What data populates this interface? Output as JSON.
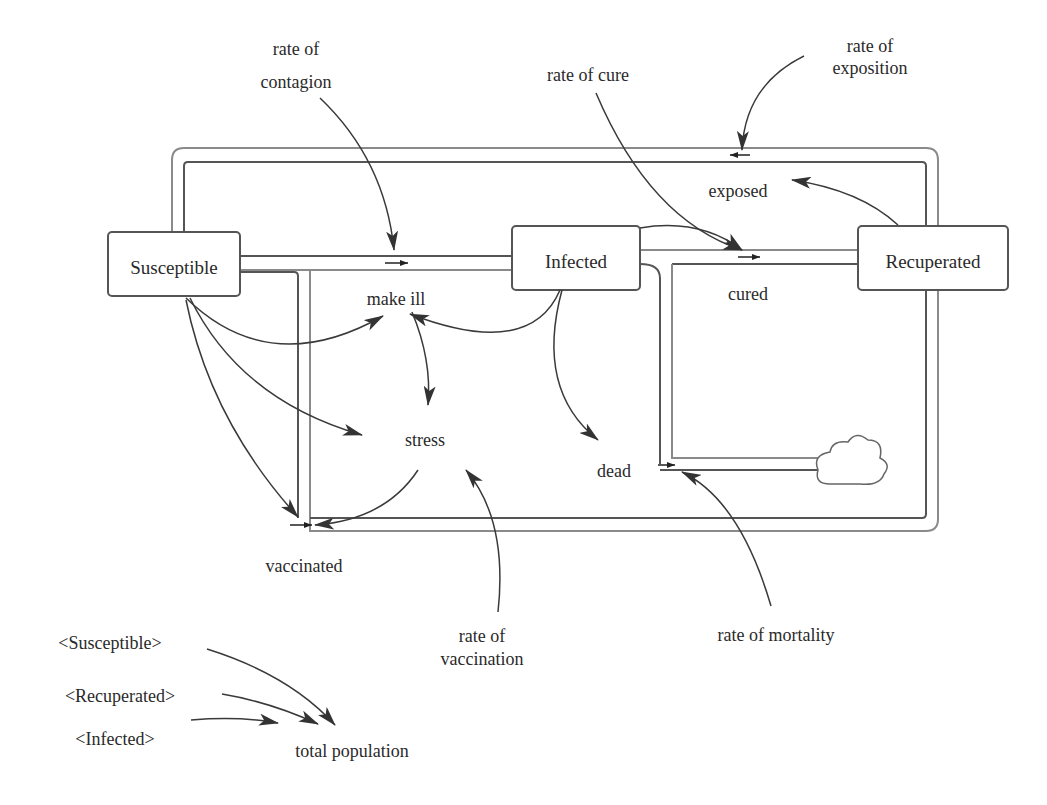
{
  "diagram": {
    "type": "stock-and-flow",
    "stocks": [
      {
        "id": "susceptible",
        "label": "Susceptible"
      },
      {
        "id": "infected",
        "label": "Infected"
      },
      {
        "id": "recuperated",
        "label": "Recuperated"
      }
    ],
    "flows": [
      {
        "id": "make_ill",
        "label": "make ill",
        "from": "Susceptible",
        "to": "Infected"
      },
      {
        "id": "cured",
        "label": "cured",
        "from": "Infected",
        "to": "Recuperated"
      },
      {
        "id": "exposed",
        "label": "exposed",
        "from": "Recuperated",
        "to": "Susceptible"
      },
      {
        "id": "vaccinated",
        "label": "vaccinated",
        "from": "Susceptible",
        "to": "Recuperated"
      },
      {
        "id": "dead",
        "label": "dead",
        "from": "Infected",
        "to": "cloud"
      }
    ],
    "auxiliaries": [
      {
        "id": "rate_contagion",
        "label_line1": "rate of",
        "label_line2": "contagion"
      },
      {
        "id": "rate_cure",
        "label": "rate of cure"
      },
      {
        "id": "rate_exposition",
        "label_line1": "rate of",
        "label_line2": "exposition"
      },
      {
        "id": "stress",
        "label": "stress"
      },
      {
        "id": "rate_vaccination",
        "label_line1": "rate of",
        "label_line2": "vaccination"
      },
      {
        "id": "rate_mortality",
        "label": "rate of mortality"
      },
      {
        "id": "total_population",
        "label": "total population"
      }
    ],
    "shadow_variables": [
      {
        "id": "shadow_susceptible",
        "label": "<Susceptible>"
      },
      {
        "id": "shadow_recuperated",
        "label": "<Recuperated>"
      },
      {
        "id": "shadow_infected",
        "label": "<Infected>"
      }
    ],
    "sink": {
      "id": "cloud",
      "icon": "cloud-icon"
    },
    "colors": {
      "line": "#555555",
      "arrow": "#333333",
      "text": "#2a2a2a",
      "background": "#ffffff"
    }
  }
}
